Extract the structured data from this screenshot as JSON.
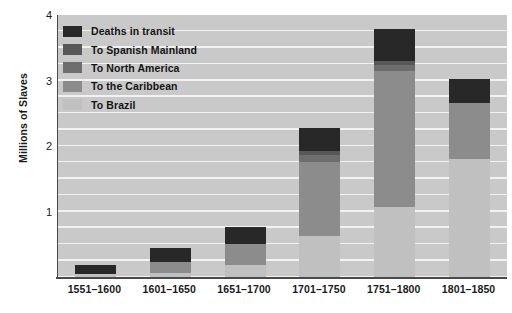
{
  "chart_data": {
    "type": "bar",
    "subtype": "stacked-bar",
    "title": "",
    "xlabel": "",
    "ylabel": "Millions of Slaves",
    "ylim": [
      0,
      4
    ],
    "yticks": [
      1,
      2,
      3,
      4
    ],
    "ytick_labels": [
      "1",
      "2",
      "3",
      "4"
    ],
    "grid": true,
    "grid_interval": 0.25,
    "grid_orientation": "horizontal",
    "legend_position": "top-left-inside",
    "categories": [
      "1551–1600",
      "1601–1650",
      "1651–1700",
      "1701–1750",
      "1751–1800",
      "1801–1850"
    ],
    "series": [
      {
        "name": "To Brazil",
        "color": "#c0c0c0",
        "values": [
          0.05,
          0.06,
          0.18,
          0.63,
          1.07,
          1.8
        ]
      },
      {
        "name": "To the Caribbean",
        "color": "#8c8c8c",
        "values": [
          0.0,
          0.17,
          0.32,
          1.12,
          2.08,
          0.86
        ]
      },
      {
        "name": "To North America",
        "color": "#6e6e6e",
        "values": [
          0.0,
          0.0,
          0.0,
          0.12,
          0.09,
          0.0
        ]
      },
      {
        "name": "To Spanish Mainland",
        "color": "#585858",
        "values": [
          0.0,
          0.0,
          0.0,
          0.05,
          0.06,
          0.0
        ]
      },
      {
        "name": "Deaths in transit",
        "color": "#282828",
        "values": [
          0.13,
          0.22,
          0.27,
          0.36,
          0.48,
          0.37
        ]
      }
    ],
    "totals": [
      0.18,
      0.45,
      0.77,
      2.28,
      3.78,
      3.03
    ]
  },
  "axis": {
    "y_title": "Millions of Slaves"
  },
  "legend": {
    "items": [
      {
        "label": "Deaths in transit",
        "color": "#282828"
      },
      {
        "label": "To Spanish Mainland",
        "color": "#585858"
      },
      {
        "label": "To North America",
        "color": "#6e6e6e"
      },
      {
        "label": "To the Caribbean",
        "color": "#8c8c8c"
      },
      {
        "label": "To Brazil",
        "color": "#c0c0c0"
      }
    ]
  },
  "style": {
    "plot_background": "#c9c9c9",
    "gridline_color": "#f2f2f2",
    "axis_color": "#4a4a4a",
    "page_background": "#ffffff",
    "text_color": "#1a1a1a"
  }
}
